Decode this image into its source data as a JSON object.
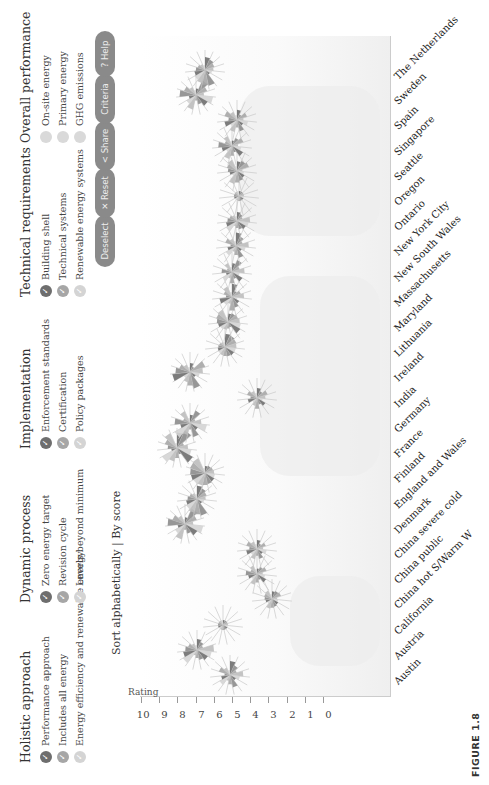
{
  "legend": {
    "groups": [
      {
        "title": "Holistic approach",
        "items": [
          {
            "label": "Performance approach",
            "color": "#6e6e6e"
          },
          {
            "label": "Includes all energy",
            "color": "#a6a6a6"
          },
          {
            "label": "Energy efficiency and renewable energy",
            "color": "#d4d4d4"
          }
        ]
      },
      {
        "title": "Dynamic process",
        "items": [
          {
            "label": "Zero energy target",
            "color": "#6e6e6e"
          },
          {
            "label": "Revision cycle",
            "color": "#a6a6a6"
          },
          {
            "label": "Levels beyond minimum",
            "color": "#d4d4d4"
          }
        ]
      },
      {
        "title": "Implementation",
        "items": [
          {
            "label": "Enforcement standards",
            "color": "#6e6e6e"
          },
          {
            "label": "Certification",
            "color": "#a6a6a6"
          },
          {
            "label": "Policy packages",
            "color": "#d4d4d4"
          }
        ]
      },
      {
        "title": "Technical requirements",
        "items": [
          {
            "label": "Building shell",
            "color": "#6e6e6e"
          },
          {
            "label": "Technical systems",
            "color": "#a6a6a6"
          },
          {
            "label": "Renewable energy systems",
            "color": "#d4d4d4"
          }
        ]
      },
      {
        "title": "Overall performance",
        "items": [
          {
            "label": "On-site energy",
            "color": "#d9d9d9"
          },
          {
            "label": "Primary energy",
            "color": "#d9d9d9"
          },
          {
            "label": "GHG emissions",
            "color": "#d9d9d9"
          }
        ]
      }
    ],
    "check_glyph": "✓"
  },
  "toolbar": {
    "deselect": "Deselect",
    "reset": "✕ Reset",
    "share": "< Share",
    "criteria": "Criteria",
    "help": "? Help"
  },
  "sort": {
    "alphabetically": "Sort alphabetically",
    "separator": " | ",
    "by_score": "By score"
  },
  "figure_label": "FIGURE 1.8",
  "chart_data": {
    "type": "scatter",
    "title": "",
    "xlabel": "",
    "ylabel": "Rating",
    "ylim": [
      0,
      10
    ],
    "yticks": [
      0,
      1,
      2,
      3,
      4,
      5,
      6,
      7,
      8,
      9,
      10
    ],
    "categories": [
      "Austin",
      "Austria",
      "California",
      "China hot S/Warm W",
      "China public",
      "China severe cold",
      "Denmark",
      "England and Wales",
      "Finland",
      "France",
      "Germany",
      "India",
      "Ireland",
      "Lithuania",
      "Maryland",
      "Massachusetts",
      "New South Wales",
      "New York City",
      "Ontario",
      "Oregon",
      "Seattle",
      "Singapore",
      "Spain",
      "Sweden",
      "The Netherlands"
    ],
    "values": [
      5.1,
      6.9,
      5.5,
      2.8,
      3.6,
      3.6,
      7.6,
      6.9,
      6.5,
      8.0,
      7.3,
      3.6,
      7.3,
      5.4,
      5.2,
      5.0,
      5.0,
      4.8,
      4.7,
      4.6,
      4.7,
      5.0,
      4.7,
      7.0,
      6.5
    ],
    "marker": "star-glyph (per-criterion radial wedges)",
    "sort_order": "alphabetical",
    "grid": false,
    "legend_position": "top"
  }
}
